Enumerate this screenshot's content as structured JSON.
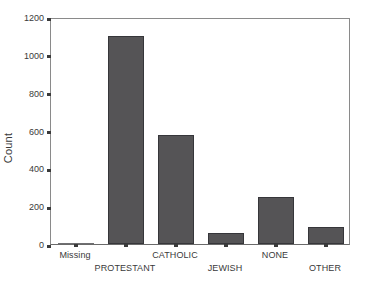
{
  "chart_data": {
    "type": "bar",
    "title": "",
    "subtitle": "",
    "xlabel": "",
    "ylabel": "Count",
    "categories": [
      "Missing",
      "PROTESTANT",
      "CATHOLIC",
      "JEWISH",
      "NONE",
      "OTHER"
    ],
    "values": [
      3,
      1102,
      575,
      58,
      248,
      91
    ],
    "ylim": [
      0,
      1200
    ],
    "yticks": [
      0,
      200,
      400,
      600,
      800,
      1000,
      1200
    ],
    "ytick_labels": [
      "0",
      "200",
      "400",
      "600",
      "800",
      "1000",
      "1200"
    ],
    "grid": false,
    "legend": null,
    "bar_color": "#555456",
    "bar_edge_color": "#36363a",
    "axis_color": "#8a8a8a",
    "background": "#ffffff",
    "label_stagger": [
      "top",
      "bottom",
      "top",
      "bottom",
      "top",
      "bottom"
    ]
  }
}
